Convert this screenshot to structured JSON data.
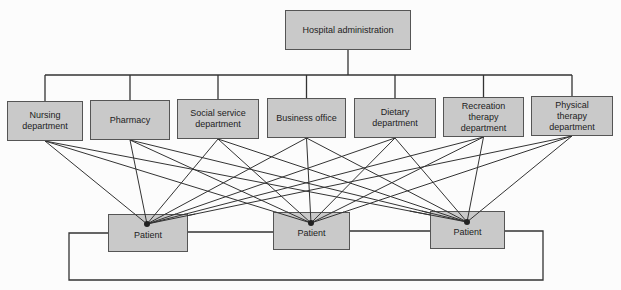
{
  "root": {
    "label": "Hospital administration",
    "box": [
      285,
      10,
      126,
      40
    ]
  },
  "departments": [
    {
      "label": "Nursing department",
      "box": [
        7,
        101,
        76,
        40
      ]
    },
    {
      "label": "Pharmacy",
      "box": [
        90,
        100,
        80,
        40
      ]
    },
    {
      "label": "Social service department",
      "box": [
        177,
        99,
        82,
        40
      ]
    },
    {
      "label": "Business office",
      "box": [
        267,
        98,
        79,
        40
      ]
    },
    {
      "label": "Dietary department",
      "box": [
        354,
        98,
        82,
        40
      ]
    },
    {
      "label": "Recreation therapy department",
      "box": [
        443,
        97,
        81,
        40
      ]
    },
    {
      "label": "Physical therapy department",
      "box": [
        531,
        96,
        82,
        40
      ]
    }
  ],
  "patients": [
    {
      "label": "Patient",
      "box": [
        108,
        214,
        80,
        38
      ],
      "dot": [
        147,
        224
      ]
    },
    {
      "label": "Patient",
      "box": [
        273,
        212,
        77,
        38
      ],
      "dot": [
        311,
        223
      ]
    },
    {
      "label": "Patient",
      "box": [
        430,
        211,
        75,
        38
      ],
      "dot": [
        467,
        222
      ]
    }
  ],
  "bus_y": 75,
  "loop": {
    "left": 69,
    "right": 543,
    "top_left": 233,
    "top_right": 231,
    "bottom": 280
  },
  "colors": {
    "line": "#333333",
    "fill": "#c9c9c9"
  }
}
